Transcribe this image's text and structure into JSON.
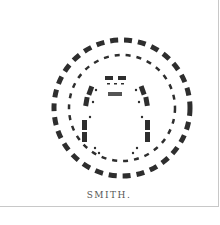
{
  "figure": {
    "caption": "SMITH.",
    "colors": {
      "ink": "#2e2e2e",
      "border": "#c8c8c8",
      "background": "#ffffff"
    },
    "center": [
      122,
      108
    ],
    "rings": [
      {
        "name": "outer-ring",
        "radius": 68,
        "stroke": 5,
        "dash": "8 6"
      },
      {
        "name": "middle-ring",
        "radius": 53,
        "stroke": 2.5,
        "dash": "5 6"
      }
    ]
  }
}
